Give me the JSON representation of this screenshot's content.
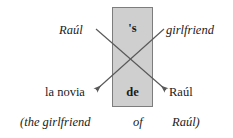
{
  "figure": {
    "type": "linguistic-transposition-diagram",
    "colors": {
      "box_fill": "#cfcfcf",
      "box_border": "#7d7d7d",
      "line": "#595959",
      "text": "#1a1a1a",
      "background": "#ffffff"
    }
  },
  "center_box": {
    "top_marker": "'s",
    "bottom_marker": "de"
  },
  "source_row": {
    "left": "Raúl",
    "right": "girlfriend"
  },
  "target_row": {
    "left": "la novia",
    "right": "Raúl"
  },
  "gloss": {
    "words": [
      "(the girlfriend",
      "of",
      "Raúl)"
    ]
  }
}
